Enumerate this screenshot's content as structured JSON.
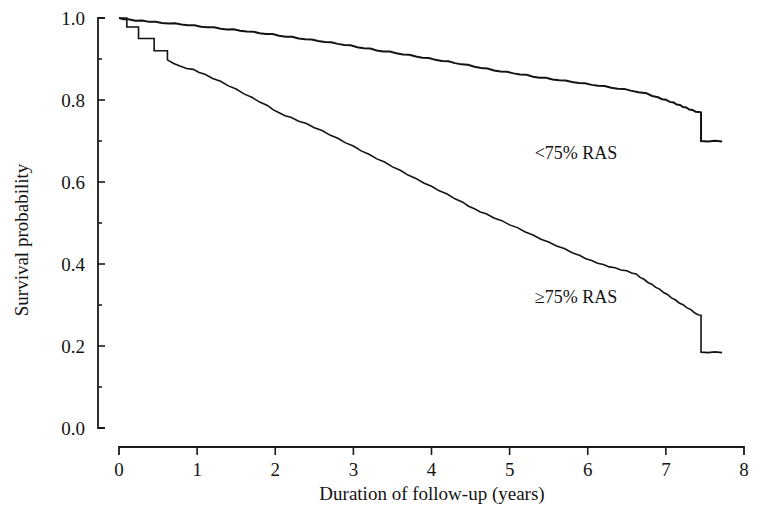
{
  "chart_data": {
    "type": "line",
    "title": "",
    "subtitle": "",
    "xlabel": "Duration of follow-up (years)",
    "ylabel": "Survival probability",
    "xlim": [
      0,
      8
    ],
    "ylim": [
      0.0,
      1.0
    ],
    "grid": false,
    "legend_position": "inline-annotation",
    "x_ticks": [
      "0",
      "1",
      "2",
      "3",
      "4",
      "5",
      "6",
      "7",
      "8"
    ],
    "x_tick_values": [
      0,
      1,
      2,
      3,
      4,
      5,
      6,
      7,
      8
    ],
    "x_minor_tick_values": [],
    "y_ticks": [
      "0.0",
      "0.2",
      "0.4",
      "0.6",
      "0.8",
      "1.0"
    ],
    "y_tick_values": [
      0.0,
      0.2,
      0.4,
      0.6,
      0.8,
      1.0
    ],
    "y_minor_tick_values": [
      0.1,
      0.3,
      0.5,
      0.7,
      0.9
    ],
    "annotations": [
      {
        "text": "<75% RAS",
        "x": 5.85,
        "y": 0.655
      },
      {
        "text": "≥75% RAS",
        "x": 5.85,
        "y": 0.305
      }
    ],
    "series": [
      {
        "name": "<75% RAS",
        "label": "<75% RAS",
        "color": "#131313",
        "line_width": 2.0,
        "step": true,
        "points": [
          [
            0.0,
            1.0
          ],
          [
            0.12,
            0.996
          ],
          [
            0.3,
            0.993
          ],
          [
            0.55,
            0.989
          ],
          [
            0.8,
            0.985
          ],
          [
            1.05,
            0.98
          ],
          [
            1.3,
            0.975
          ],
          [
            1.55,
            0.97
          ],
          [
            1.8,
            0.964
          ],
          [
            2.05,
            0.958
          ],
          [
            2.3,
            0.951
          ],
          [
            2.55,
            0.945
          ],
          [
            2.8,
            0.938
          ],
          [
            3.05,
            0.93
          ],
          [
            3.3,
            0.922
          ],
          [
            3.55,
            0.915
          ],
          [
            3.8,
            0.907
          ],
          [
            4.05,
            0.899
          ],
          [
            4.3,
            0.891
          ],
          [
            4.55,
            0.882
          ],
          [
            4.8,
            0.873
          ],
          [
            5.05,
            0.866
          ],
          [
            5.3,
            0.858
          ],
          [
            5.55,
            0.851
          ],
          [
            5.8,
            0.845
          ],
          [
            6.05,
            0.838
          ],
          [
            6.3,
            0.831
          ],
          [
            6.55,
            0.824
          ],
          [
            6.75,
            0.816
          ],
          [
            6.9,
            0.806
          ],
          [
            7.0,
            0.8
          ],
          [
            7.1,
            0.793
          ],
          [
            7.18,
            0.787
          ],
          [
            7.26,
            0.781
          ],
          [
            7.34,
            0.775
          ],
          [
            7.42,
            0.77
          ],
          [
            7.45,
            0.7
          ],
          [
            7.72,
            0.7
          ]
        ]
      },
      {
        "name": "≥75% RAS",
        "label": "≥75% RAS",
        "color": "#131313",
        "line_width": 1.6,
        "step": true,
        "points": [
          [
            0.0,
            1.0
          ],
          [
            0.1,
            0.978
          ],
          [
            0.25,
            0.95
          ],
          [
            0.45,
            0.92
          ],
          [
            0.62,
            0.898
          ],
          [
            0.78,
            0.882
          ],
          [
            0.95,
            0.874
          ],
          [
            1.1,
            0.862
          ],
          [
            1.3,
            0.845
          ],
          [
            1.5,
            0.826
          ],
          [
            1.7,
            0.806
          ],
          [
            1.9,
            0.786
          ],
          [
            2.05,
            0.768
          ],
          [
            2.2,
            0.757
          ],
          [
            2.4,
            0.742
          ],
          [
            2.6,
            0.725
          ],
          [
            2.8,
            0.706
          ],
          [
            3.0,
            0.687
          ],
          [
            3.2,
            0.667
          ],
          [
            3.4,
            0.648
          ],
          [
            3.6,
            0.628
          ],
          [
            3.8,
            0.608
          ],
          [
            4.0,
            0.589
          ],
          [
            4.2,
            0.57
          ],
          [
            4.4,
            0.55
          ],
          [
            4.55,
            0.534
          ],
          [
            4.7,
            0.522
          ],
          [
            4.9,
            0.505
          ],
          [
            5.1,
            0.488
          ],
          [
            5.3,
            0.47
          ],
          [
            5.5,
            0.453
          ],
          [
            5.7,
            0.437
          ],
          [
            5.9,
            0.42
          ],
          [
            6.05,
            0.408
          ],
          [
            6.2,
            0.398
          ],
          [
            6.35,
            0.39
          ],
          [
            6.5,
            0.383
          ],
          [
            6.62,
            0.375
          ],
          [
            6.72,
            0.362
          ],
          [
            6.82,
            0.35
          ],
          [
            6.92,
            0.338
          ],
          [
            7.02,
            0.325
          ],
          [
            7.12,
            0.312
          ],
          [
            7.22,
            0.3
          ],
          [
            7.32,
            0.288
          ],
          [
            7.42,
            0.275
          ],
          [
            7.45,
            0.185
          ],
          [
            7.72,
            0.185
          ]
        ]
      }
    ]
  },
  "axes": {
    "x_title": "Duration of follow-up (years)",
    "y_title": "Survival probability"
  }
}
